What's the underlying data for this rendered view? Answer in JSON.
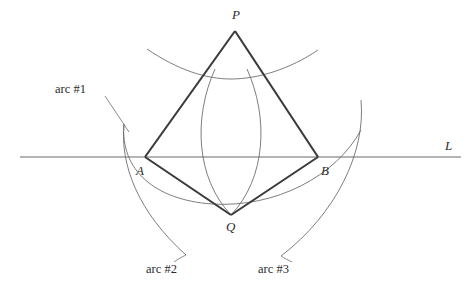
{
  "figure": {
    "width": 470,
    "height": 290,
    "background": "#ffffff",
    "stroke_thick": "#3a3a3a",
    "stroke_thin": "#6e6e6e",
    "stroke_line": "#6a6a6a",
    "text_color": "#2b2b2b"
  },
  "points": [
    {
      "id": "P",
      "label": "P",
      "x": 235,
      "y": 31,
      "label_x": 232,
      "label_y": 9
    },
    {
      "id": "A",
      "label": "A",
      "x": 145,
      "y": 157,
      "label_x": 136,
      "label_y": 165
    },
    {
      "id": "B",
      "label": "B",
      "x": 318,
      "y": 157,
      "label_x": 321,
      "label_y": 165
    },
    {
      "id": "Q",
      "label": "Q",
      "x": 231,
      "y": 215,
      "label_x": 226,
      "label_y": 220
    }
  ],
  "line": {
    "id": "L",
    "label": "L",
    "x1": 20,
    "y1": 157,
    "x2": 461,
    "y2": 157,
    "label_x": 445,
    "label_y": 140
  },
  "kite": {
    "vertices": [
      "P",
      "B",
      "Q",
      "A"
    ],
    "path": "M 235 31 L 318 157 L 231 215 L 145 157 Z"
  },
  "arcs": [
    {
      "id": "arc1",
      "label": "arc #1",
      "center": "P",
      "path": "M 147 49 Q 231 92 318 50",
      "leader": "M 106 97 Q 118 108 129 131",
      "label_x": 55,
      "label_y": 83
    },
    {
      "id": "arc2",
      "label": "arc #2",
      "center": "B",
      "path": "M 124 124 Q 131 201 185 255",
      "leader": "M 184 256 Q 179 258 174 261",
      "label_x": 146,
      "label_y": 263
    },
    {
      "id": "arc3",
      "label": "arc #3",
      "center": "A",
      "path": "M 360 100 Q 347 200 281 257",
      "leader": "M 282 257 Q 285 259 289 261",
      "label_x": 258,
      "label_y": 263
    },
    {
      "id": "arc-wide",
      "label": "",
      "center": "P",
      "path": "M 172 191 Q 231 228 345 158",
      "leader": "",
      "label_x": 0,
      "label_y": 0
    },
    {
      "id": "arc-lens-left",
      "label": "",
      "center": "A",
      "path": "M 231 215 Q 196 160 231 73",
      "leader": "",
      "label_x": 0,
      "label_y": 0
    },
    {
      "id": "arc-lens-right",
      "label": "",
      "center": "B",
      "path": "M 231 215 Q 265 160 231 73",
      "leader": "",
      "label_x": 0,
      "label_y": 0
    }
  ]
}
